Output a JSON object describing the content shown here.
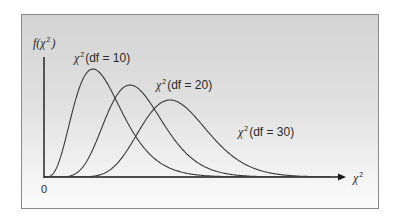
{
  "chart_data": {
    "type": "line",
    "title": "",
    "xlabel": "χ²",
    "ylabel": "f(χ²)",
    "origin_label": "0",
    "grid": false,
    "legend": "inline labels",
    "series": [
      {
        "name": "χ²(df = 10)",
        "df": 10,
        "mode_x": 8,
        "peak_position": "left"
      },
      {
        "name": "χ²(df = 20)",
        "df": 20,
        "mode_x": 18,
        "peak_position": "middle"
      },
      {
        "name": "χ²(df = 30)",
        "df": 30,
        "mode_x": 28,
        "peak_position": "right"
      }
    ],
    "xlim": [
      0,
      80
    ],
    "ylim": [
      0,
      0.11
    ]
  },
  "labels": {
    "y_axis": {
      "f": "f(χ",
      "sup": "2",
      "close": ")"
    },
    "x_axis": {
      "chi": "χ",
      "sup": "2"
    },
    "origin": "0",
    "curve_df10": {
      "chi": "χ",
      "sup": "2",
      "text": "(df = 10)"
    },
    "curve_df20": {
      "chi": "χ",
      "sup": "2",
      "text": "(df = 20)"
    },
    "curve_df30": {
      "chi": "χ",
      "sup": "2",
      "text": "(df = 30)"
    }
  },
  "colors": {
    "curve": "#3a3a3a",
    "axis": "#1a1a1a",
    "frame_border": "#8a8a8a"
  }
}
